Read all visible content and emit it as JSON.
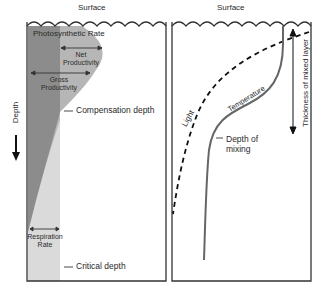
{
  "left_panel": {
    "surface_label": "Surface",
    "title": "Photosynthetic Rate",
    "net_productivity": "Net Productivity",
    "gross_productivity": "Gross Productivity",
    "compensation_depth": "Compensation depth",
    "respiration_rate": "Respiration Rate",
    "critical_depth": "Critical depth",
    "depth_axis": "Depth"
  },
  "right_panel": {
    "surface_label": "Surface",
    "light_label": "Light",
    "temperature_label": "Temperature",
    "depth_of_mixing": "Depth of mixing",
    "mixed_layer": "Thickness of mixed layer"
  },
  "colors": {
    "dark_shade": "#8a8a8a",
    "mid_shade": "#b4b4b4",
    "light_shade": "#d9d9d9",
    "outline": "#333333"
  }
}
